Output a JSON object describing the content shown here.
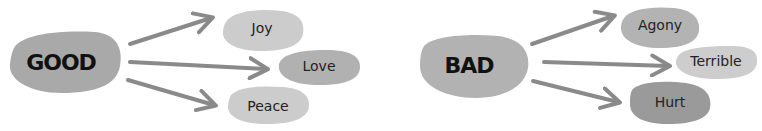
{
  "diagrams": [
    {
      "root": {
        "label": "GOOD",
        "color": "#a9a9a9"
      },
      "children": [
        {
          "label": "Joy",
          "color": "#cccccc"
        },
        {
          "label": "Love",
          "color": "#b1b1b1"
        },
        {
          "label": "Peace",
          "color": "#cccccc"
        }
      ]
    },
    {
      "root": {
        "label": "BAD",
        "color": "#b2b2b2"
      },
      "children": [
        {
          "label": "Agony",
          "color": "#b3b3b3"
        },
        {
          "label": "Terrible",
          "color": "#cdcdcd"
        },
        {
          "label": "Hurt",
          "color": "#9a9a9a"
        }
      ]
    }
  ],
  "colors": {
    "arrow": "#8a8a8a",
    "text": "#111111"
  }
}
